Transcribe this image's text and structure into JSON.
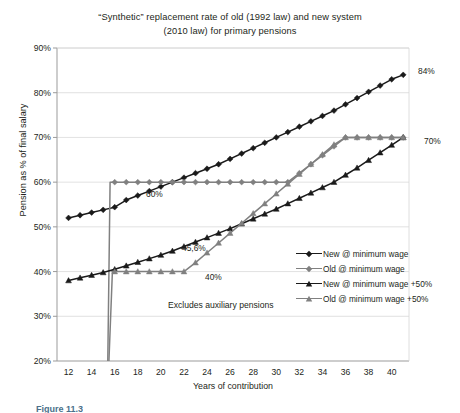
{
  "chart_data": {
    "type": "line",
    "title": "“Synthetic” replacement rate of old (1992 law) and new system (2010 law) for primary pensions",
    "title_line1": "“Synthetic” replacement rate of old (1992 law) and new system",
    "title_line2": "(2010 law) for primary pensions",
    "xlabel": "Years of contribution",
    "ylabel": "Pension as % of final salary",
    "xlim": [
      11,
      41.5
    ],
    "ylim": [
      20,
      90
    ],
    "xticks": [
      12,
      14,
      16,
      18,
      20,
      22,
      24,
      26,
      28,
      30,
      32,
      34,
      36,
      38,
      40
    ],
    "xtick_labels": [
      "12",
      "14",
      "16",
      "18",
      "20",
      "22",
      "24",
      "26",
      "28",
      "30",
      "32",
      "34",
      "36",
      "38",
      "40"
    ],
    "yticks": [
      20,
      30,
      40,
      50,
      60,
      70,
      80,
      90
    ],
    "ytick_labels": [
      "20%",
      "30%",
      "40%",
      "50%",
      "60%",
      "70%",
      "80%",
      "90%"
    ],
    "grid": "horizontal",
    "legend_position": "inside-right",
    "note": "Excludes auxiliary pensions",
    "series": [
      {
        "name": "New @ minimum wage",
        "color": "#1a1a1a",
        "marker": "diamond",
        "x": [
          12,
          13,
          14,
          15,
          16,
          17,
          18,
          19,
          20,
          21,
          22,
          23,
          24,
          25,
          26,
          27,
          28,
          29,
          30,
          31,
          32,
          33,
          34,
          35,
          36,
          37,
          38,
          39,
          40,
          41
        ],
        "y": [
          52.0,
          52.6,
          53.2,
          53.8,
          54.4,
          56.0,
          57.0,
          58.0,
          59.0,
          60.0,
          61.0,
          62.0,
          63.0,
          64.0,
          65.2,
          66.4,
          67.6,
          68.8,
          70.0,
          71.2,
          72.4,
          73.6,
          74.8,
          76.0,
          77.4,
          78.8,
          80.2,
          81.6,
          83.0,
          84.0
        ]
      },
      {
        "name": "Old @ minimum wage",
        "color": "#808080",
        "marker": "diamond",
        "x": [
          15.4,
          15.6,
          16,
          17,
          18,
          19,
          20,
          21,
          22,
          23,
          24,
          25,
          26,
          27,
          28,
          29,
          30,
          31,
          32,
          33,
          34,
          35,
          36,
          37,
          38,
          39,
          40,
          41
        ],
        "y": [
          20.0,
          60.0,
          60.0,
          60.0,
          60.0,
          60.0,
          60.0,
          60.0,
          60.0,
          60.0,
          60.0,
          60.0,
          60.0,
          60.0,
          60.0,
          60.0,
          60.0,
          60.0,
          62.0,
          64.0,
          66.0,
          68.0,
          70.0,
          70.0,
          70.0,
          70.0,
          70.0,
          70.0
        ]
      },
      {
        "name": "New @ minimum wage +50%",
        "color": "#1a1a1a",
        "marker": "triangle",
        "x": [
          12,
          13,
          14,
          15,
          16,
          17,
          18,
          19,
          20,
          21,
          22,
          23,
          24,
          25,
          26,
          27,
          28,
          29,
          30,
          31,
          32,
          33,
          34,
          35,
          36,
          37,
          38,
          39,
          40,
          41
        ],
        "y": [
          38.0,
          38.6,
          39.2,
          39.8,
          40.5,
          41.3,
          42.1,
          42.9,
          43.7,
          44.6,
          45.6,
          46.6,
          47.6,
          48.6,
          49.6,
          50.7,
          51.8,
          52.9,
          54.0,
          55.2,
          56.4,
          57.6,
          58.8,
          60.0,
          61.6,
          63.2,
          64.9,
          66.6,
          68.3,
          70.0
        ]
      },
      {
        "name": "Old @ minimum wage +50%",
        "color": "#808080",
        "marker": "triangle",
        "x": [
          15.5,
          15.8,
          16,
          17,
          18,
          19,
          20,
          21,
          22,
          23,
          24,
          25,
          26,
          27,
          28,
          29,
          30,
          31,
          32,
          33,
          34,
          35,
          36,
          37,
          38,
          39,
          40,
          41
        ],
        "y": [
          20.0,
          40.0,
          40.0,
          40.0,
          40.0,
          40.0,
          40.0,
          40.0,
          40.0,
          42.0,
          44.2,
          46.4,
          48.6,
          50.8,
          53.0,
          55.2,
          57.4,
          59.6,
          61.8,
          64.0,
          66.2,
          68.4,
          70.0,
          70.0,
          70.0,
          70.0,
          70.0,
          70.0
        ]
      }
    ],
    "annotations": [
      {
        "text": "60%",
        "x_px": 146,
        "y_px": 189
      },
      {
        "text": "40%",
        "x_px": 205,
        "y_px": 272
      },
      {
        "text": "45,6%",
        "x_px": 182,
        "y_px": 243
      },
      {
        "text": "84%",
        "x_px": 418,
        "y_px": 66
      },
      {
        "text": "70%",
        "x_px": 424,
        "y_px": 136
      }
    ]
  },
  "caption": {
    "text": "Figure 11.3"
  }
}
